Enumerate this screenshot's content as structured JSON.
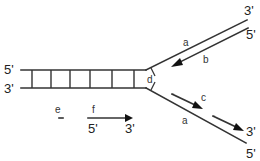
{
  "diagram": {
    "labels": {
      "parent_top_5prime": "5'",
      "parent_bottom_3prime": "3'",
      "upper_arm_3prime": "3'",
      "upper_arm_5prime": "5'",
      "lower_arm_3prime": "3'",
      "lower_arm_5prime": "5'",
      "primer_5prime": "5'",
      "primer_3prime": "3'",
      "a_upper": "a",
      "a_lower": "a",
      "b": "b",
      "c": "c",
      "d": "d",
      "e": "e",
      "f": "f"
    },
    "ladder_rung_count": 7,
    "colors": {
      "line": "#333333",
      "arrow": "#111111",
      "background": "#ffffff"
    }
  }
}
